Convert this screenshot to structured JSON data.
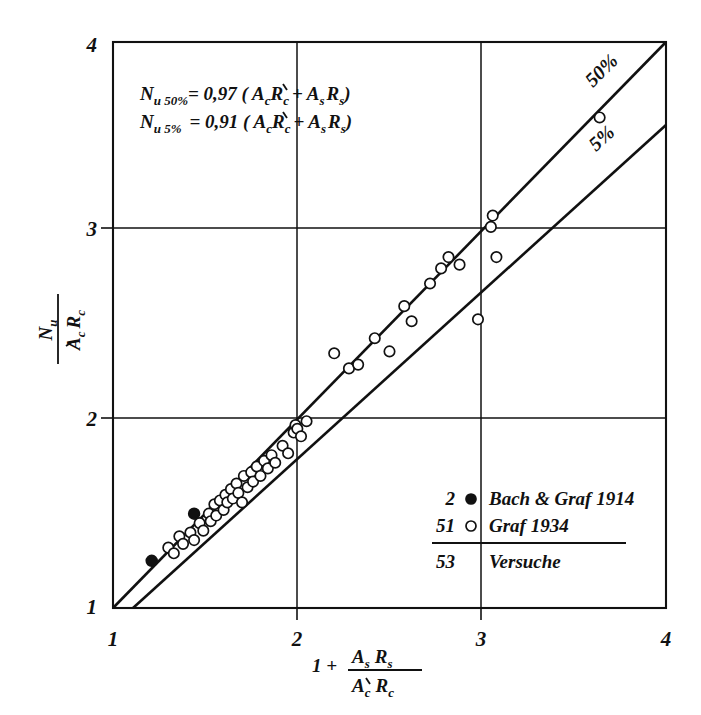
{
  "chart_data": {
    "type": "scatter",
    "title": "",
    "xlabel": "1 + (As Rs) / (A'c Rc)",
    "ylabel": "Nu / (A'c Rc)",
    "xlim": [
      1,
      4
    ],
    "ylim": [
      1,
      4
    ],
    "xticks": [
      "1",
      "2",
      "3",
      "4"
    ],
    "yticks": [
      "1",
      "2",
      "3",
      "4"
    ],
    "grid": true,
    "legend_position": "lower-right-inside",
    "annotations": [
      "N u 50% = 0,97 ( A'c Rc + As Rs )",
      "N u 5% = 0,91 ( A'c Rc + As Rs )"
    ],
    "line_labels": [
      "50%",
      "5%"
    ],
    "series": [
      {
        "name": "Bach & Graf 1914",
        "marker": "filled-circle",
        "count": 2,
        "points": [
          [
            1.21,
            1.25
          ],
          [
            1.44,
            1.5
          ]
        ]
      },
      {
        "name": "Graf 1934",
        "marker": "open-circle",
        "count": 51,
        "points": [
          [
            1.3,
            1.32
          ],
          [
            1.33,
            1.29
          ],
          [
            1.36,
            1.38
          ],
          [
            1.38,
            1.34
          ],
          [
            1.42,
            1.4
          ],
          [
            1.44,
            1.36
          ],
          [
            1.47,
            1.45
          ],
          [
            1.49,
            1.41
          ],
          [
            1.52,
            1.5
          ],
          [
            1.53,
            1.46
          ],
          [
            1.55,
            1.55
          ],
          [
            1.56,
            1.49
          ],
          [
            1.58,
            1.57
          ],
          [
            1.6,
            1.52
          ],
          [
            1.61,
            1.6
          ],
          [
            1.62,
            1.56
          ],
          [
            1.64,
            1.63
          ],
          [
            1.65,
            1.58
          ],
          [
            1.67,
            1.66
          ],
          [
            1.68,
            1.61
          ],
          [
            1.7,
            1.56
          ],
          [
            1.71,
            1.7
          ],
          [
            1.73,
            1.64
          ],
          [
            1.75,
            1.72
          ],
          [
            1.76,
            1.67
          ],
          [
            1.78,
            1.75
          ],
          [
            1.8,
            1.7
          ],
          [
            1.82,
            1.78
          ],
          [
            1.84,
            1.74
          ],
          [
            1.86,
            1.81
          ],
          [
            1.88,
            1.77
          ],
          [
            1.92,
            1.86
          ],
          [
            1.95,
            1.82
          ],
          [
            1.98,
            1.93
          ],
          [
            1.99,
            1.97
          ],
          [
            2.0,
            1.95
          ],
          [
            2.02,
            1.91
          ],
          [
            2.05,
            1.99
          ],
          [
            2.2,
            2.35
          ],
          [
            2.28,
            2.27
          ],
          [
            2.33,
            2.29
          ],
          [
            2.42,
            2.43
          ],
          [
            2.5,
            2.36
          ],
          [
            2.58,
            2.6
          ],
          [
            2.62,
            2.52
          ],
          [
            2.72,
            2.72
          ],
          [
            2.78,
            2.8
          ],
          [
            2.82,
            2.86
          ],
          [
            2.88,
            2.82
          ],
          [
            2.98,
            2.53
          ],
          [
            3.05,
            3.02
          ],
          [
            3.06,
            3.08
          ],
          [
            3.08,
            2.86
          ],
          [
            3.64,
            3.6
          ]
        ]
      }
    ],
    "fit_lines": [
      {
        "name": "50%",
        "label": "50%",
        "equation_coefficient": 0.97,
        "from": [
          1.0,
          1.0
        ],
        "to": [
          4.0,
          4.0
        ]
      },
      {
        "name": "5%",
        "label": "5%",
        "equation_coefficient": 0.91,
        "from": [
          1.1,
          1.0
        ],
        "to": [
          4.0,
          3.56
        ]
      }
    ]
  },
  "equations": {
    "line1": {
      "lhs_main": "N",
      "lhs_sub": "u 50%",
      "rhs": "= 0,97 ( A",
      "a_sub": "c",
      "r1": "R",
      "r1_sub": "c",
      "plus": "+",
      "a2": "A",
      "a2_sub": "s",
      "r2": "R",
      "r2_sub": "s",
      "close": ")"
    },
    "line2": {
      "lhs_main": "N",
      "lhs_sub": "u 5%",
      "rhs": "= 0,91 ( A",
      "a_sub": "c",
      "r1": "R",
      "r1_sub": "c",
      "plus": "+",
      "a2": "A",
      "a2_sub": "s",
      "r2": "R",
      "r2_sub": "s",
      "close": ")"
    }
  },
  "legend": {
    "rows": [
      {
        "count": "2",
        "marker": "filled-circle",
        "label": "Bach & Graf 1914"
      },
      {
        "count": "51",
        "marker": "open-circle",
        "label": "Graf 1934"
      }
    ],
    "total": {
      "count": "53",
      "label": "Versuche"
    }
  },
  "axes": {
    "x_tick_labels": [
      "1",
      "2",
      "3",
      "4"
    ],
    "y_tick_labels": [
      "1",
      "2",
      "3",
      "4"
    ],
    "x_label": {
      "lead": "1 +",
      "num_a": "A",
      "num_a_sub": "s",
      "num_r": "R",
      "num_r_sub": "s",
      "den_a": "A",
      "den_a_sub": "c",
      "den_r": "R",
      "den_r_sub": "c"
    },
    "y_label": {
      "num_n": "N",
      "num_n_sub": "u",
      "den_a": "A",
      "den_a_sub": "c",
      "den_r": "R",
      "den_r_sub": "c"
    }
  },
  "line_labels": {
    "upper": "50%",
    "lower": "5%"
  },
  "colors": {
    "ink": "#111111",
    "background": "#ffffff"
  }
}
